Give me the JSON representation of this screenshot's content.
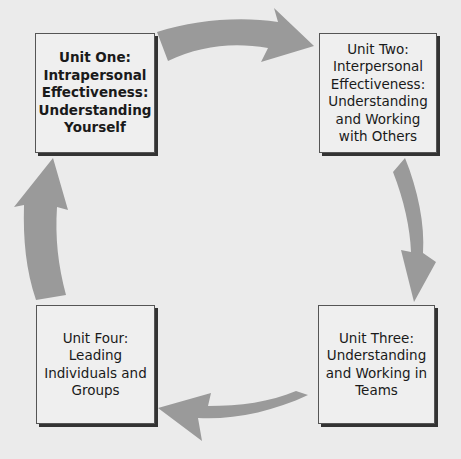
{
  "diagram": {
    "type": "cycle",
    "colors": {
      "background": "#ebebeb",
      "arrow": "#9a9a9a",
      "box_fill": "#efefef",
      "box_border": "#555555",
      "shadow": "#333333"
    },
    "units": [
      {
        "id": "unit-one",
        "label": "Unit One:\nIntrapersonal\nEffectiveness:\nUnderstanding\nYourself",
        "emphasis": "bold"
      },
      {
        "id": "unit-two",
        "label": "Unit Two:\nInterpersonal\nEffectiveness:\nUnderstanding\nand Working\nwith Others",
        "emphasis": "normal"
      },
      {
        "id": "unit-three",
        "label": "Unit Three:\nUnderstanding\nand Working in\nTeams",
        "emphasis": "normal"
      },
      {
        "id": "unit-four",
        "label": "Unit Four:\nLeading\nIndividuals and\nGroups",
        "emphasis": "normal"
      }
    ],
    "arrows": [
      {
        "from": "unit-one",
        "to": "unit-two",
        "direction": "right"
      },
      {
        "from": "unit-two",
        "to": "unit-three",
        "direction": "down"
      },
      {
        "from": "unit-three",
        "to": "unit-four",
        "direction": "left"
      },
      {
        "from": "unit-four",
        "to": "unit-one",
        "direction": "up"
      }
    ]
  }
}
